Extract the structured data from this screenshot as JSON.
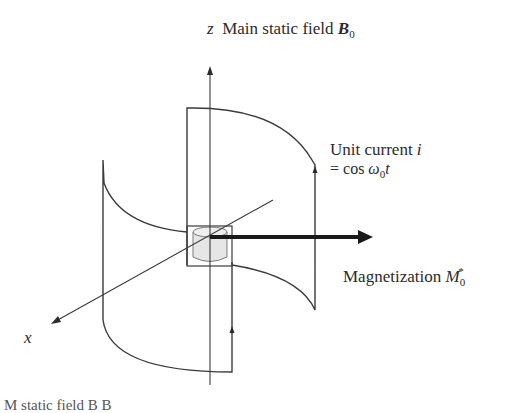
{
  "diagram": {
    "type": "mri-coil-schematic",
    "labels": {
      "z_axis": {
        "var": "z",
        "text": "Main static field",
        "symbol": "B",
        "subscript": "0"
      },
      "current": {
        "line1_text": "Unit current",
        "line1_var": "i",
        "line2_prefix": "= cos ",
        "omega": "ω",
        "omega_sub": "0",
        "t": "t"
      },
      "magnetization": {
        "text": "Magnetization",
        "symbol": "M",
        "subscript": "0",
        "superscript": "*"
      },
      "x_axis": {
        "var": "x"
      },
      "bottom_caption_partial": "M    static field B    B"
    },
    "elements": [
      "z-axis",
      "x-axis",
      "front-saddle-coil",
      "back-saddle-coil",
      "sample-box",
      "sample-cylinder",
      "magnetization-vector",
      "current-direction-arrows"
    ],
    "colors": {
      "line": "#3a3a3a",
      "thick_arrow": "#1a1a1a",
      "cylinder_fill": "#e6e6e6"
    }
  }
}
